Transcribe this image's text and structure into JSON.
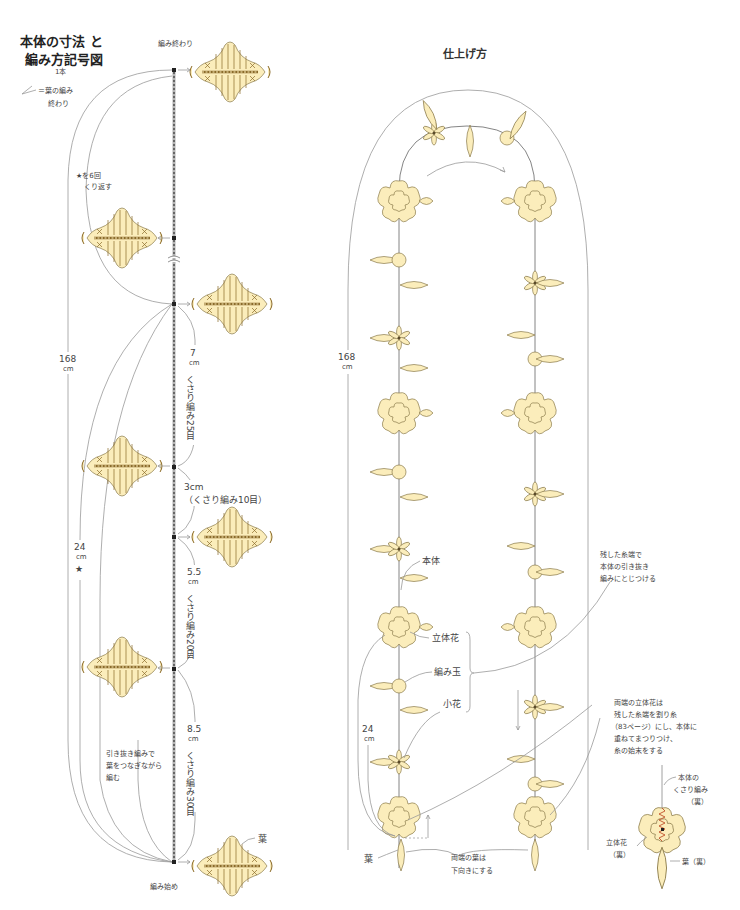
{
  "left_panel": {
    "title_line1": "本体の寸法 と",
    "title_line2": "編み方記号図",
    "quantity": "1本",
    "legend_symbol_text": "＝葉の編み",
    "legend_symbol_text2": "終わり",
    "end_label": "編み終わり",
    "start_label": "編み始め",
    "repeat_note_line1": "★を6回",
    "repeat_note_line2": "くり返す",
    "total_length": "168",
    "total_unit": "cm",
    "repeat_length": "24",
    "repeat_unit": "cm",
    "repeat_star": "★",
    "seg1_len": "7",
    "seg1_unit": "cm",
    "seg1_desc": "くさり編み25目",
    "seg2_len": "3cm",
    "seg2_desc": "（くさり編み10目）",
    "seg3_len": "5.5",
    "seg3_unit": "cm",
    "seg3_desc": "くさり編み20目",
    "seg4_len": "8.5",
    "seg4_unit": "cm",
    "seg4_desc": "くさり編み30目",
    "join_note_line1": "引き抜き編みで",
    "join_note_line2": "葉をつなぎながら",
    "join_note_line3": "編む",
    "leaf_label": "葉"
  },
  "right_panel": {
    "title": "仕上げ方",
    "total_length": "168",
    "total_unit": "cm",
    "bottom_length": "24",
    "bottom_unit": "cm",
    "body_label": "本体",
    "flower3d_label": "立体花",
    "ball_label": "編み玉",
    "small_flower_label": "小花",
    "leaf_label": "葉",
    "thread_note_line1": "残した糸端で",
    "thread_note_line2": "本体の引き抜き",
    "thread_note_line3": "編みにとじつける",
    "ends_note_line1": "両端の立体花は",
    "ends_note_line2": "残した糸端を割り糸",
    "ends_note_line3": "（83ページ）にし、本体に",
    "ends_note_line4": "重ねてまつりつけ、",
    "ends_note_line5": "糸の始末をする",
    "leaves_down_line1": "両端の葉は",
    "leaves_down_line2": "下向きにする",
    "detail_body_line1": "本体の",
    "detail_body_line2": "くさり編み",
    "detail_body_line3": "（裏）",
    "detail_flower_line1": "立体花",
    "detail_flower_line2": "（裏）",
    "detail_leaf": "葉（裏）"
  },
  "colors": {
    "motif_fill": "#fbedbb",
    "motif_stroke": "#8a7a4a",
    "line": "#999999",
    "stitch_accent": "#c0502a"
  }
}
